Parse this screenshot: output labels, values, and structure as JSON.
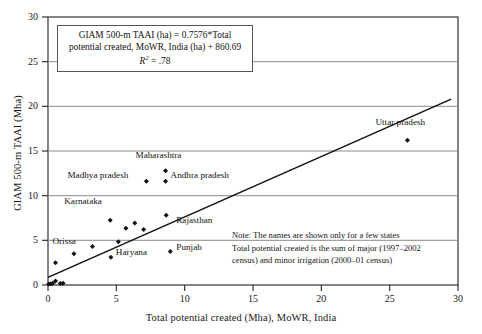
{
  "chart_data": {
    "type": "scatter",
    "title": "",
    "xlabel": "Total potential created (Mha), MoWR, India",
    "ylabel": "GIAM 500-m TAAI (Mha)",
    "xlim": [
      0,
      30
    ],
    "ylim": [
      0,
      30
    ],
    "xticks": [
      "0",
      "5",
      "10",
      "15",
      "20",
      "25",
      "30"
    ],
    "yticks": [
      "0",
      "5",
      "10",
      "15",
      "20",
      "25",
      "30"
    ],
    "grid": "horizontal",
    "legend": "none",
    "marker": "diamond",
    "marker_color": "#111111",
    "points": [
      {
        "x": 0.05,
        "y": 0.1,
        "label": ""
      },
      {
        "x": 0.2,
        "y": 0.15,
        "label": ""
      },
      {
        "x": 0.35,
        "y": 0.2,
        "label": ""
      },
      {
        "x": 0.55,
        "y": 0.45,
        "label": ""
      },
      {
        "x": 0.9,
        "y": 0.18,
        "label": ""
      },
      {
        "x": 1.1,
        "y": 0.2,
        "label": ""
      },
      {
        "x": 0.55,
        "y": 2.5,
        "label": ""
      },
      {
        "x": 1.9,
        "y": 3.5,
        "label": ""
      },
      {
        "x": 3.25,
        "y": 4.3,
        "label": "Orissa"
      },
      {
        "x": 4.55,
        "y": 7.25,
        "label": "Karnataka"
      },
      {
        "x": 4.6,
        "y": 3.1,
        "label": "Haryana"
      },
      {
        "x": 5.15,
        "y": 4.85,
        "label": ""
      },
      {
        "x": 5.7,
        "y": 6.35,
        "label": ""
      },
      {
        "x": 6.35,
        "y": 6.95,
        "label": ""
      },
      {
        "x": 7.0,
        "y": 6.2,
        "label": ""
      },
      {
        "x": 7.2,
        "y": 11.6,
        "label": "Madhya pradesh"
      },
      {
        "x": 8.6,
        "y": 12.8,
        "label": "Maharashtra"
      },
      {
        "x": 8.6,
        "y": 11.6,
        "label": "Andhra pradesh"
      },
      {
        "x": 8.65,
        "y": 7.8,
        "label": "Rajasthan"
      },
      {
        "x": 8.95,
        "y": 3.75,
        "label": "Punjab"
      },
      {
        "x": 26.3,
        "y": 16.2,
        "label": "Uttar pradesh"
      }
    ],
    "trendline": {
      "slope": 0.7576,
      "intercept": 0.86069,
      "x_start": 0.0,
      "x_end": 29.5,
      "y_start": 0.86,
      "y_end": 20.8,
      "color": "#111111"
    },
    "annotations": {
      "equation_line1": "GIAM 500-m TAAI (ha) = 0.7576*Total",
      "equation_line2": "potential created, MoWR, India (ha) + 860.69",
      "r_squared_value": ".78",
      "r_squared_prefix": "R",
      "r_squared_exp": "2",
      "r_squared_eq": " = ",
      "note_line1": "Note: The names are shown only for a few states",
      "note_line2": "Total potential created is the sum of major (1997–2002",
      "note_line3": "census)  and minor irrigation (2000–01 census)"
    },
    "point_labels": {
      "orissa": "Orissa",
      "karnataka": "Karnataka",
      "haryana": "Haryana",
      "madhya_pradesh": "Madhya pradesh",
      "maharashtra": "Maharashtra",
      "andhra_pradesh": "Andhra pradesh",
      "rajasthan": "Rajasthan",
      "punjab": "Punjab",
      "uttar_pradesh": "Uttar pradesh"
    },
    "colors": {
      "axis": "#222222",
      "gridline": "#8a8a8a",
      "marker": "#111111",
      "trendline": "#111111",
      "box_border": "#555555"
    }
  }
}
